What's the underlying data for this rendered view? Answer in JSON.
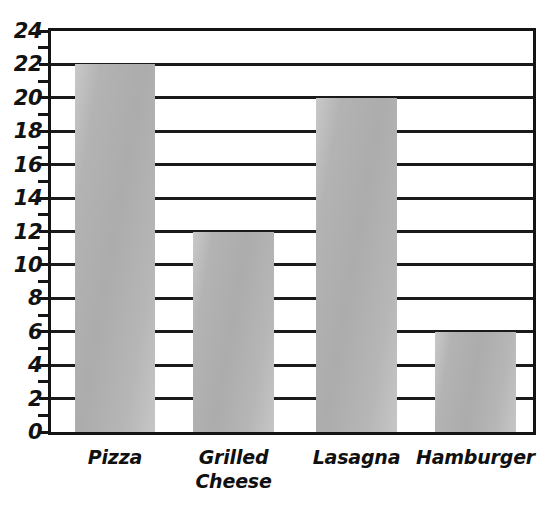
{
  "chart_data": {
    "type": "bar",
    "title": "",
    "xlabel": "",
    "ylabel": "",
    "categories": [
      "Pizza",
      "Grilled\nCheese",
      "Lasagna",
      "Hamburger"
    ],
    "values": [
      22,
      12,
      20,
      6
    ],
    "ylim": [
      0,
      24
    ],
    "ytick_step": 2,
    "yticks": [
      0,
      2,
      4,
      6,
      8,
      10,
      12,
      14,
      16,
      18,
      20,
      22,
      24
    ],
    "ytick_labels": [
      "0",
      "2",
      "4",
      "6",
      "8",
      "10",
      "12",
      "14",
      "16",
      "18",
      "20",
      "22",
      "24"
    ],
    "minor_ticks": [
      1,
      3,
      5,
      7,
      9,
      11,
      13,
      15,
      17,
      19,
      21,
      23
    ],
    "grid": true,
    "grid_axis": "y",
    "legend": false,
    "legend_position": "none",
    "bar_color": "#b4b4b4",
    "axis_color": "#141414",
    "background_color": "#ffffff"
  },
  "axes": {
    "y_axis_name": "y-axis",
    "x_axis_name": "x-axis"
  }
}
